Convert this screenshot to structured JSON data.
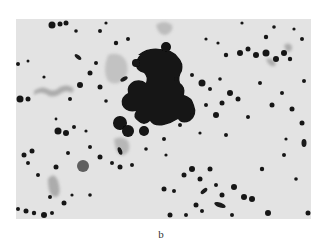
{
  "figure": {
    "panel_label": "b",
    "image": {
      "description": "grayscale light micrograph showing a large central dark aggregate surrounded by scattered dark stained particles and a few faint gray filamentous smears",
      "background_color": "#e6e6e6",
      "particle_color": "#141414",
      "smear_color": "#9a9a9a",
      "cell_color": "#6a6a6a"
    }
  }
}
